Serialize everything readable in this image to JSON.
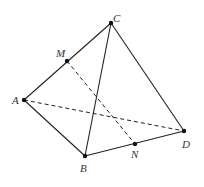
{
  "diagram": {
    "stroke_color": "#222222",
    "points": {
      "A": {
        "label": "A",
        "x": 24,
        "y": 100
      },
      "B": {
        "label": "B",
        "x": 85,
        "y": 156
      },
      "C": {
        "label": "C",
        "x": 111,
        "y": 23
      },
      "D": {
        "label": "D",
        "x": 184,
        "y": 131
      },
      "M": {
        "label": "M",
        "x": 67,
        "y": 61
      },
      "N": {
        "label": "N",
        "x": 135,
        "y": 144
      }
    },
    "solid_edges": [
      "AC",
      "AB",
      "BC",
      "BD",
      "CD"
    ],
    "dashed_edges": [
      "AD",
      "MN"
    ]
  }
}
